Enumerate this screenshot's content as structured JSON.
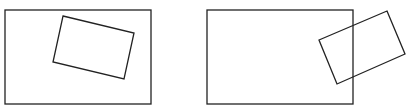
{
  "figure": {
    "panels": [
      {
        "name": "panel-left",
        "outer_rect": {
          "x": 5,
          "y": 10,
          "w": 146,
          "h": 94
        },
        "inner_polygon": "63,16 134,33 124,79 53,62",
        "relation": "inner rectangle fully inside outer rectangle"
      },
      {
        "name": "panel-right",
        "outer_rect": {
          "x": 207,
          "y": 10,
          "w": 146,
          "h": 94
        },
        "inner_polygon": "387,11 405,54 337,84 319,40",
        "relation": "inner rectangle partially overlapping outer rectangle's right edge"
      }
    ],
    "stroke_color": "#222222",
    "stroke_width": 1.3
  }
}
